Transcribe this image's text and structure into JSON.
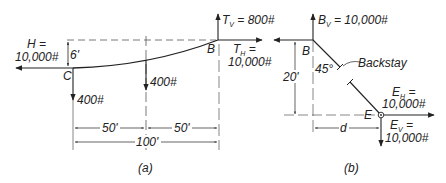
{
  "figure_a": {
    "caption": "(a)",
    "point_B": "B",
    "point_C": "C",
    "tv_label": "T",
    "tv_sub": "V",
    "tv_value": " = 800#",
    "th_label": "T",
    "th_sub": "H",
    "th_eq": " =",
    "th_value": "10,000#",
    "h_label": "H =",
    "h_value": "10,000#",
    "sag": "6'",
    "load_c": "400#",
    "load_mid": "400#",
    "dim_left": "50'",
    "dim_right": "50'",
    "dim_total": "100'"
  },
  "figure_b": {
    "caption": "(b)",
    "point_B": "B",
    "point_E": "E",
    "bv_label": "B",
    "bv_sub": "V",
    "bv_value": " = 10,000#",
    "angle": "45°",
    "backstay": "Backstay",
    "height": "20'",
    "eh_label": "E",
    "eh_sub": "H",
    "eh_eq": " =",
    "eh_value": "10,000#",
    "ev_label": "E",
    "ev_sub": "V",
    "ev_eq": " =",
    "ev_value": "10,000#",
    "dim_d": "d"
  },
  "colors": {
    "ink": "#222222",
    "dashed": "#555555"
  }
}
